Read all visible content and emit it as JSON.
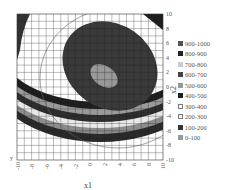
{
  "chart_data": {
    "type": "heatmap",
    "subtype": "filled-contour",
    "title": "",
    "xlabel": "x1",
    "ylabel": "x2",
    "xlim": [
      -10,
      10
    ],
    "ylim": [
      -10,
      10
    ],
    "x_ticks": [
      "-10",
      "-8",
      "-6",
      "-4",
      "-2",
      "0",
      "2",
      "4",
      "6",
      "8",
      "10"
    ],
    "y_ticks": [
      "10",
      "8",
      "6",
      "4",
      "2",
      "0",
      "-2",
      "-4",
      "-6",
      "-8",
      "-10"
    ],
    "grid": true,
    "grid_step": 1,
    "legend_position": "right",
    "levels": [
      {
        "label": "900-1000",
        "color": "#555555"
      },
      {
        "label": "800-900",
        "color": "#222222"
      },
      {
        "label": "700-800",
        "color": "#cccccc"
      },
      {
        "label": "600-700",
        "color": "#444444"
      },
      {
        "label": "500-600",
        "color": "#999999"
      },
      {
        "label": "400-500",
        "color": "#1e1e1e"
      },
      {
        "label": "300-400",
        "color": "#ffffff"
      },
      {
        "label": "200-300",
        "color": "#ffffff"
      },
      {
        "label": "100-200",
        "color": "#333333"
      },
      {
        "label": "0-100",
        "color": "#999999"
      }
    ],
    "features": {
      "inner_ellipse_center": [
        2.2,
        1.5
      ],
      "outer_dark_ellipse_center": [
        2.0,
        3.0
      ],
      "band_region": "lower half, curved bands from x2≈-2 to x2≈-7"
    }
  }
}
